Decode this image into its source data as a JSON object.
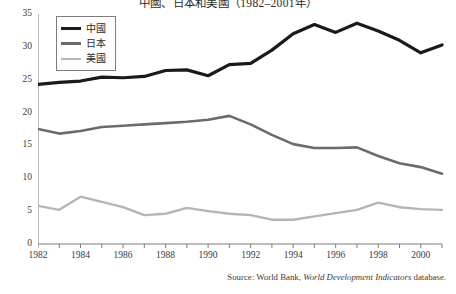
{
  "chart_data": {
    "type": "line",
    "title": "中國、日本和美國（1982–2001年）",
    "xlabel": "",
    "ylabel": "",
    "xlim": [
      1982,
      2001
    ],
    "ylim": [
      0,
      35
    ],
    "grid": false,
    "legend_position": "top-left",
    "x": [
      1982,
      1983,
      1984,
      1985,
      1986,
      1987,
      1988,
      1989,
      1990,
      1991,
      1992,
      1993,
      1994,
      1995,
      1996,
      1997,
      1998,
      1999,
      2000,
      2001
    ],
    "y_ticks": [
      0,
      5,
      10,
      15,
      20,
      25,
      30,
      35
    ],
    "x_ticks": [
      1982,
      1984,
      1986,
      1988,
      1990,
      1992,
      1994,
      1996,
      1998,
      2000
    ],
    "series": [
      {
        "name": "中國",
        "color": "#1a1a1a",
        "width": 3.2,
        "values": [
          24.3,
          24.6,
          24.8,
          25.4,
          25.3,
          25.5,
          26.4,
          26.5,
          25.6,
          27.3,
          27.5,
          29.5,
          32.0,
          33.4,
          32.2,
          33.6,
          32.4,
          31.0,
          29.1,
          30.3
        ]
      },
      {
        "name": "日本",
        "color": "#6b6b6b",
        "width": 2.6,
        "values": [
          17.5,
          16.8,
          17.2,
          17.8,
          18.0,
          18.2,
          18.4,
          18.6,
          18.9,
          19.5,
          18.2,
          16.6,
          15.2,
          14.6,
          14.6,
          14.7,
          13.4,
          12.3,
          11.7,
          10.7
        ]
      },
      {
        "name": "美國",
        "color": "#b5b5b5",
        "width": 2.4,
        "values": [
          5.8,
          5.2,
          7.2,
          6.4,
          5.6,
          4.4,
          4.6,
          5.5,
          5.0,
          4.6,
          4.4,
          3.7,
          3.7,
          4.2,
          4.7,
          5.2,
          6.3,
          5.6,
          5.3,
          5.2
        ]
      }
    ],
    "source_prefix": "Source: World Bank,",
    "source_italic": "World Development Indicators",
    "source_suffix": "database."
  },
  "legend": {
    "items": [
      {
        "label": "中國"
      },
      {
        "label": "日本"
      },
      {
        "label": "美國"
      }
    ]
  },
  "axis": {
    "color": "#7d7d7d"
  }
}
